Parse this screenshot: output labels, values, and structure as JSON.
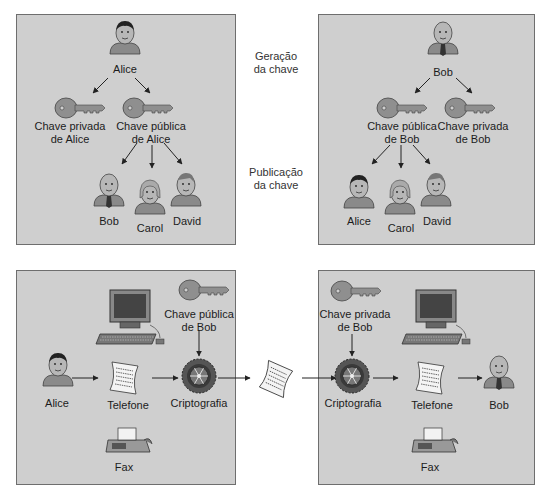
{
  "colors": {
    "panel_bg": "#cfcfcf",
    "panel_border": "#6e6e6e",
    "key_fill": "#8f8f8f",
    "arrow": "#222222"
  },
  "middle_labels": {
    "key_generation": [
      "Geração",
      "da chave"
    ],
    "key_publication": [
      "Publicação",
      "da chave"
    ]
  },
  "top_left": {
    "owner": "Alice",
    "private_key": [
      "Chave privada",
      "de Alice"
    ],
    "public_key": [
      "Chave pública",
      "de Alice"
    ],
    "recipients": [
      "Bob",
      "Carol",
      "David"
    ]
  },
  "top_right": {
    "owner": "Bob",
    "public_key": [
      "Chave pública",
      "de Bob"
    ],
    "private_key": [
      "Chave privada",
      "de Bob"
    ],
    "recipients": [
      "Alice",
      "Carol",
      "David"
    ]
  },
  "bottom_left": {
    "sender": "Alice",
    "channel": "Telefone",
    "fax": "Fax",
    "key": [
      "Chave pública",
      "de Bob"
    ],
    "process": "Criptografia"
  },
  "bottom_right": {
    "key": [
      "Chave privada",
      "de Bob"
    ],
    "process": "Criptografia",
    "channel": "Telefone",
    "fax": "Fax",
    "receiver": "Bob"
  }
}
